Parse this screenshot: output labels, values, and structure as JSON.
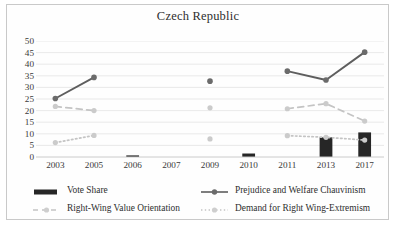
{
  "chart_data": {
    "type": "line",
    "title": "Czech Republic",
    "xlabel": "",
    "ylabel": "",
    "categories": [
      "2003",
      "2005",
      "2006",
      "2007",
      "2009",
      "2010",
      "2011",
      "2013",
      "2017"
    ],
    "ylim": [
      0,
      50
    ],
    "yticks": [
      0,
      5,
      10,
      15,
      20,
      25,
      30,
      35,
      40,
      45,
      50
    ],
    "grid": true,
    "legend_position": "bottom",
    "series": [
      {
        "name": "Vote Share",
        "type": "bar",
        "color": "#262626",
        "values": [
          null,
          null,
          0.2,
          null,
          null,
          1.5,
          null,
          8.5,
          10.6
        ]
      },
      {
        "name": "Prejudice and Welfare Chauvinism",
        "type": "line",
        "style": "solid",
        "color": "#5e5e5e",
        "values": [
          25.2,
          34.3,
          null,
          null,
          32.7,
          null,
          37.0,
          33.2,
          45.2
        ]
      },
      {
        "name": "Right-Wing Value Orientation",
        "type": "line",
        "style": "dashed",
        "color": "#c4c4c4",
        "values": [
          21.8,
          20.0,
          null,
          null,
          21.2,
          null,
          20.8,
          23.0,
          15.5
        ]
      },
      {
        "name": "Demand for Right Wing-Extremism",
        "type": "line",
        "style": "dotted",
        "color": "#c4c4c4",
        "values": [
          6.2,
          9.3,
          null,
          null,
          7.8,
          null,
          9.2,
          8.5,
          7.3
        ]
      }
    ]
  },
  "legend": {
    "items": [
      {
        "label": "Vote Share",
        "marker": "bar-swatch",
        "color": "#262626"
      },
      {
        "label": "Right-Wing Value Orientation",
        "marker": "dashed-line-marker",
        "color": "#c4c4c4"
      },
      {
        "label": "Prejudice and Welfare Chauvinism",
        "marker": "solid-line-marker",
        "color": "#5e5e5e"
      },
      {
        "label": "Demand for Right Wing-Extremism",
        "marker": "dotted-line-marker",
        "color": "#c4c4c4"
      }
    ]
  }
}
